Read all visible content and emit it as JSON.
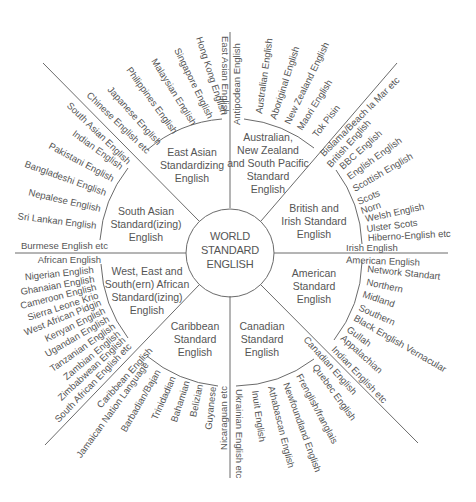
{
  "diagram": {
    "center": {
      "lines": [
        "WORLD",
        "STANDARD",
        "ENGLISH"
      ]
    },
    "sectors": [
      {
        "id": "east-asian",
        "title_lines": [
          "East Asian",
          "Standardizing",
          "English"
        ],
        "varieties": [
          "East Asian English",
          "Hong Kong English",
          "Singapore English",
          "Malaysian English",
          "Philippines English",
          "Japanese English",
          "Chinese English etc"
        ]
      },
      {
        "id": "australian",
        "title_lines": [
          "Australian,",
          "New Zealand",
          "and South Pacific",
          "Standard",
          "English"
        ],
        "varieties": [
          "Antipodean English",
          "Australian English",
          "Aboriginal English",
          "New Zealand English",
          "Maori English",
          "Tok Pisin",
          "Bislama/Beach la Mar etc"
        ]
      },
      {
        "id": "british-irish",
        "title_lines": [
          "British and",
          "Irish Standard",
          "English"
        ],
        "varieties": [
          "British English",
          "BBC English",
          "English English",
          "Scottish English",
          "Scots",
          "Norn",
          "Welsh English",
          "Ulster Scots",
          "Hiberno-English etc",
          "Irish English"
        ]
      },
      {
        "id": "american",
        "title_lines": [
          "American",
          "Standard",
          "English"
        ],
        "varieties": [
          "American English",
          "Network Standart",
          "Northern",
          "Midland",
          "Southern",
          "Black English Vernacular",
          "Gullah",
          "Appalachian",
          "Indian English etc"
        ]
      },
      {
        "id": "canadian",
        "title_lines": [
          "Canadian",
          "Standard",
          "English"
        ],
        "varieties": [
          "Canadian English",
          "Quebec English",
          "Frenglish/franglais",
          "Newfoundland English",
          "Athabascan English",
          "Inuit English",
          "Ukrainian English etc"
        ]
      },
      {
        "id": "caribbean",
        "title_lines": [
          "Caribbean",
          "Standard",
          "English"
        ],
        "varieties": [
          "Caribbean English",
          "Jamaican Nation Language",
          "Barbadian/Bajan",
          "Trinidadian",
          "Bahamian",
          "Belizian",
          "Guyanese",
          "Nicaraguan etc"
        ]
      },
      {
        "id": "african",
        "title_lines": [
          "West, East and",
          "South(ern) African",
          "Standard(izing)",
          "English"
        ],
        "varieties": [
          "African English",
          "Nigerian English",
          "Ghanaian English",
          "Cameroon English",
          "Sierra Leone Krio",
          "West African Pidgin",
          "Kenyan English",
          "Ugandan English",
          "Tanzanian English",
          "Zambian English",
          "Zimbabwean English",
          "South African English etc"
        ]
      },
      {
        "id": "south-asian",
        "title_lines": [
          "South Asian",
          "Standard(izing)",
          "English"
        ],
        "varieties": [
          "South Asian English",
          "Indian English",
          "Pakistani English",
          "Bangladeshi English",
          "Nepalese English",
          "Sri Lankan English",
          "Burmese English etc"
        ]
      }
    ]
  }
}
